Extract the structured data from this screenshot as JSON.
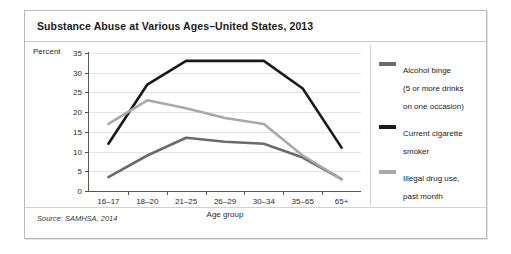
{
  "figure": {
    "title": "Substance Abuse at Various Ages–United States, 2013",
    "source": "Source: SAMHSA, 2014"
  },
  "colors": {
    "alcohol_binge": "#6b6b6b",
    "current_cigarette_smoker": "#1a1a1a",
    "illegal_drug_use": "#a8a8a8",
    "gridline": "#e4e4e4",
    "axis": "#555555",
    "panel_border": "#b9b9b9"
  },
  "legend": {
    "position": "right",
    "items": [
      {
        "label": "Alcohol binge\n(5 or more drinks\non one occasion)",
        "color_key": "alcohol_binge"
      },
      {
        "label": "Current cigarette\nsmoker",
        "color_key": "current_cigarette_smoker"
      },
      {
        "label": "Illegal drug use,\npast month",
        "color_key": "illegal_drug_use"
      }
    ]
  },
  "chart_data": {
    "type": "line",
    "title": "Substance Abuse at Various Ages–United States, 2013",
    "xlabel": "Age group",
    "ylabel": "Percent",
    "ylim": [
      0,
      35
    ],
    "yticks": [
      0,
      5,
      10,
      15,
      20,
      25,
      30,
      35
    ],
    "grid": true,
    "categories": [
      "16–17",
      "18–20",
      "21–25",
      "26–29",
      "30–34",
      "35–65",
      "65+"
    ],
    "series": [
      {
        "name": "Alcohol binge (5 or more drinks on one occasion)",
        "color": "#6b6b6b",
        "values": [
          3.5,
          9.0,
          13.5,
          12.5,
          12.0,
          8.5,
          3.0
        ]
      },
      {
        "name": "Current cigarette smoker",
        "color": "#1a1a1a",
        "values": [
          12.0,
          27.0,
          33.0,
          33.0,
          33.0,
          26.0,
          11.0
        ]
      },
      {
        "name": "Illegal drug use, past month",
        "color": "#a8a8a8",
        "values": [
          17.0,
          23.0,
          21.0,
          18.5,
          17.0,
          9.0,
          3.0
        ]
      }
    ]
  }
}
